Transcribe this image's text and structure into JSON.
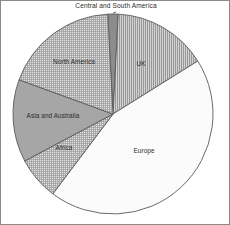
{
  "chart_data": {
    "type": "pie",
    "title": "Central and South America",
    "xlabel": "",
    "ylabel": "",
    "legend_position": "none",
    "grid": false,
    "labels_inside": true,
    "categories": [
      "Central and South America",
      "UK",
      "Europe",
      "Africa",
      "Asia and Australia",
      "North America"
    ],
    "values": [
      2,
      15,
      44,
      7,
      13,
      19
    ],
    "units": "percent",
    "slices": [
      {
        "label": "Central and South America",
        "value": 2,
        "start_angle": 357,
        "end_angle": 3,
        "fill": "#8c8c8c",
        "pattern": "solid-gray",
        "label_placement": "outside-top",
        "label_x": 115,
        "label_y": 7
      },
      {
        "label": "UK",
        "value": 15,
        "start_angle": 3,
        "end_angle": 58,
        "fill": "#b9b9b9",
        "pattern": "vertical-lines",
        "label_placement": "inside",
        "label_x": 140,
        "label_y": 65
      },
      {
        "label": "Europe",
        "value": 44,
        "start_angle": 58,
        "end_angle": 217,
        "fill": "#fbfbfb",
        "pattern": "none",
        "label_placement": "inside",
        "label_x": 143,
        "label_y": 152
      },
      {
        "label": "Africa",
        "value": 7,
        "start_angle": 217,
        "end_angle": 242,
        "fill": "#cfcfcf",
        "pattern": "fine-crosshatch",
        "label_placement": "inside",
        "label_x": 63,
        "label_y": 149
      },
      {
        "label": "Asia and Australia",
        "value": 13,
        "start_angle": 242,
        "end_angle": 290,
        "fill": "#a6a6a6",
        "pattern": "solid-gray",
        "label_placement": "inside",
        "label_x": 52,
        "label_y": 117
      },
      {
        "label": "North America",
        "value": 19,
        "start_angle": 290,
        "end_angle": 357,
        "fill": "#cfcfcf",
        "pattern": "fine-crosshatch",
        "label_placement": "inside",
        "label_x": 73,
        "label_y": 63
      }
    ],
    "geometry": {
      "center_x": 112,
      "center_y": 113,
      "radius": 100
    }
  }
}
